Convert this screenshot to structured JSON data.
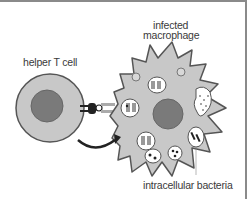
{
  "diagram": {
    "labels": {
      "helper_t_cell": "helper T cell",
      "infected_macrophage_line1": "infected",
      "infected_macrophage_line2": "macrophage",
      "intracellular_bacteria": "intracellular bacteria"
    },
    "colors": {
      "cell_fill": "#c8c8c8",
      "cell_outline": "#555555",
      "nucleus": "#7a7a7a",
      "arrow": "#222222",
      "vesicle_fill": "#ffffff",
      "bacteria": "#333333"
    }
  }
}
